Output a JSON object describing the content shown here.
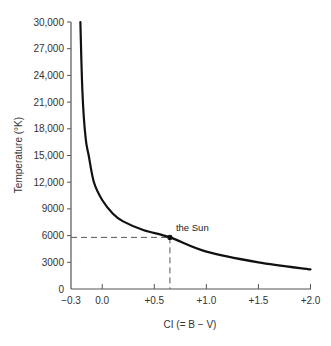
{
  "chart_data": {
    "type": "line",
    "title": "",
    "xlabel": "CI (= B − V)",
    "ylabel": "Temperature (°K)",
    "xlim": [
      -0.3,
      2.0
    ],
    "ylim": [
      0,
      30000
    ],
    "grid": false,
    "legend": null,
    "x_ticks": [
      {
        "value": -0.3,
        "label": "−0.3"
      },
      {
        "value": 0.0,
        "label": "0.0"
      },
      {
        "value": 0.5,
        "label": "+0.5"
      },
      {
        "value": 1.0,
        "label": "+1.0"
      },
      {
        "value": 1.5,
        "label": "+1.5"
      },
      {
        "value": 2.0,
        "label": "+2.0"
      }
    ],
    "y_ticks": [
      {
        "value": 0,
        "label": "0"
      },
      {
        "value": 3000,
        "label": "3000"
      },
      {
        "value": 6000,
        "label": "6000"
      },
      {
        "value": 9000,
        "label": "9000"
      },
      {
        "value": 12000,
        "label": "12,000"
      },
      {
        "value": 15000,
        "label": "15,000"
      },
      {
        "value": 18000,
        "label": "18,000"
      },
      {
        "value": 21000,
        "label": "21,000"
      },
      {
        "value": 24000,
        "label": "24,000"
      },
      {
        "value": 27000,
        "label": "27,000"
      },
      {
        "value": 30000,
        "label": "30,000"
      }
    ],
    "series": [
      {
        "name": "Temperature vs color index",
        "color": "#111111",
        "x": [
          -0.21,
          -0.19,
          -0.16,
          -0.13,
          -0.08,
          0.0,
          0.1,
          0.2,
          0.4,
          0.65,
          1.0,
          1.5,
          2.0
        ],
        "y": [
          30000,
          22000,
          17000,
          15000,
          12000,
          10000,
          8500,
          7600,
          6600,
          5800,
          4200,
          3000,
          2200
        ]
      }
    ],
    "annotations": [
      {
        "label": "the Sun",
        "x": 0.65,
        "y": 5800,
        "marker": "dot",
        "dashed_guides": true
      }
    ]
  },
  "colors": {
    "axis": "#555555",
    "curve": "#111111",
    "guide": "#555555",
    "text": "#333333"
  }
}
